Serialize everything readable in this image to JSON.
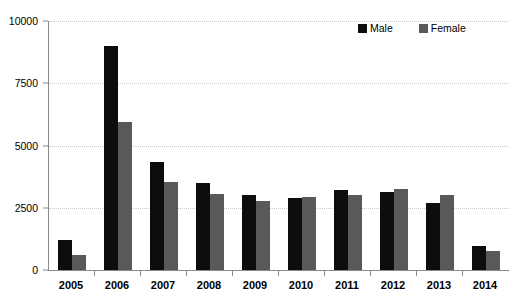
{
  "chart_data": {
    "type": "bar",
    "title": "",
    "xlabel": "",
    "ylabel": "",
    "categories": [
      "2005",
      "2006",
      "2007",
      "2008",
      "2009",
      "2010",
      "2011",
      "2012",
      "2013",
      "2014"
    ],
    "series": [
      {
        "name": "Male",
        "color": "#0d0d0d",
        "values": [
          1200,
          9000,
          4350,
          3500,
          3000,
          2900,
          3200,
          3150,
          2700,
          950
        ]
      },
      {
        "name": "Female",
        "color": "#595959",
        "values": [
          620,
          5950,
          3550,
          3050,
          2780,
          2950,
          3000,
          3250,
          3000,
          750
        ]
      }
    ],
    "ylim": [
      0,
      10000
    ],
    "yticks": [
      0,
      2500,
      5000,
      7500,
      10000
    ],
    "ytick_labels": [
      "0",
      "2500",
      "5000",
      "7500",
      "10000"
    ],
    "grid": true,
    "legend_position": "top-right",
    "axis_color": "#8a8a8a",
    "gridline_color": "#c9c9c9",
    "background": "#ffffff"
  },
  "legend": {
    "entries": [
      {
        "label": "Male",
        "color": "#0d0d0d"
      },
      {
        "label": "Female",
        "color": "#595959"
      }
    ]
  }
}
